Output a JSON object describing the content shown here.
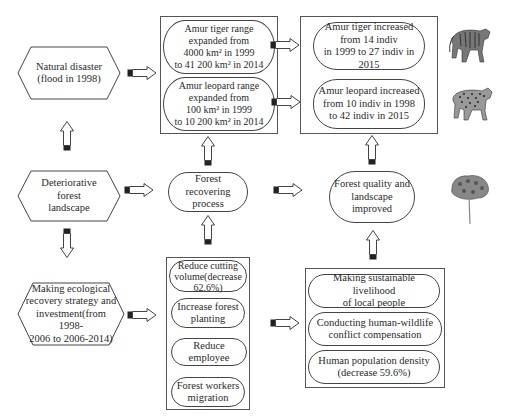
{
  "diagram": {
    "left_column": {
      "natural_disaster": "Natural disaster\n(flood in 1998)",
      "deteriorative": "Deteriorative forest\nlandscape",
      "strategy": "Making ecological\nrecovery strategy and\ninvestment(from 1998-\n2006 to 2006-2014)"
    },
    "range_group": {
      "tiger_range": "Amur tiger range\nexpanded from\n4000 km² in 1999\nto 41 200 km² in 2014",
      "leopard_range": "Amur leopard range\nexpanded from\n100 km² in 1999\nto 10 200 km² in 2014"
    },
    "population_group": {
      "tiger_pop": "Amur tiger increased\nfrom 14 indiv\nin 1999 to 27 indiv in 2015",
      "leopard_pop": "Amur leopard increased\nfrom 10 indiv in 1998\nto 42 indiv in 2015"
    },
    "forest_recovering": "Forest recovering\nprocess",
    "forest_quality": "Forest quality and\nlandscape improved",
    "actions_group": {
      "items": [
        "Reduce cutting\nvolume(decrease\n62.6%)",
        "Increase forest\nplanting",
        "Reduce employee",
        "Forest workers\nmigration"
      ]
    },
    "social_group": {
      "items": [
        "Making sustainable livelihood\nof local people",
        "Conducting human-wildlife\nconflict compensation",
        "Human population density\n(decrease 59.6%)"
      ]
    },
    "images": {
      "tiger": "tiger-illustration",
      "leopard": "leopard-illustration",
      "tree": "tree-illustration"
    }
  }
}
